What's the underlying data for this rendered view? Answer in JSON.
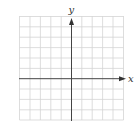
{
  "diagram": {
    "type": "coordinate-plane",
    "x_axis_label": "x",
    "y_axis_label": "y",
    "grid": {
      "columns": 10,
      "rows": 10,
      "line_color": "#d4d4d4",
      "axis_color": "#444444"
    }
  }
}
